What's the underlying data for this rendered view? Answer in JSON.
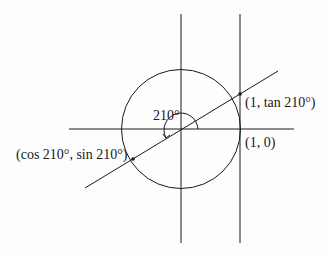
{
  "diagram": {
    "type": "unit-circle-tangent",
    "angle_label": "210°",
    "labels": {
      "tan_point": "(1, tan 210°)",
      "unit_point": "(1, 0)",
      "cos_sin_point": "(cos 210°, sin 210°)"
    },
    "colors": {
      "stroke": "#1a1a1a",
      "background": "#fdfdfd"
    }
  }
}
